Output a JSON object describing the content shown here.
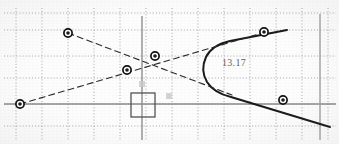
{
  "canvas": {
    "width": 339,
    "height": 144,
    "background": "#fdfdfd"
  },
  "colors": {
    "grid": "#8a8a8a",
    "axis": "#8d8d8d",
    "curve": "#1a1a1a",
    "dashed_line": "#2b2b2b",
    "marker_stroke": "#111111",
    "marker_fill": "#1b1b1b",
    "selection_box": "#555555",
    "label_text": "#4a4a4a",
    "ghost_marker": "#c9c9c9"
  },
  "labels": [
    {
      "name": "coordinate-readout",
      "text": "13.17",
      "x": 222,
      "y": 57
    }
  ],
  "chart_data": {
    "type": "scatter",
    "title": "",
    "subtitle": "",
    "xlabel": "",
    "ylabel": "",
    "grid": true,
    "legend": null,
    "axis_origin_px": {
      "x": 142,
      "y": 104
    },
    "grid_spacing_px": {
      "x": 26,
      "y": 26
    },
    "xlim": [
      -5.5,
      7.6
    ],
    "ylim": [
      -1.5,
      4.0
    ],
    "axes": [
      {
        "name": "x-axis",
        "orientation": "horizontal",
        "y_px": 104,
        "x0_px": 4,
        "x1_px": 336,
        "color": "#8d8d8d"
      },
      {
        "name": "y-axis",
        "orientation": "vertical",
        "x_px": 142,
        "y0_px": 16,
        "y1_px": 140,
        "color": "#8d8d8d"
      },
      {
        "name": "right-boundary-line",
        "orientation": "vertical",
        "x_px": 320,
        "y0_px": 14,
        "y1_px": 140,
        "color": "#a0a0a0"
      }
    ],
    "gridlines": {
      "vertical_px": [
        16,
        42,
        68,
        94,
        120,
        146,
        172,
        198,
        224,
        250,
        276,
        302,
        328
      ],
      "horizontal_px": [
        13,
        30,
        56,
        78,
        104,
        126
      ]
    },
    "points": [
      {
        "label": "P1",
        "px": [
          20,
          104
        ],
        "value": [
          -4.7,
          0.0
        ]
      },
      {
        "label": "P2",
        "px": [
          127,
          70
        ],
        "value": [
          -0.58,
          1.31
        ]
      },
      {
        "label": "P3",
        "px": [
          155,
          56
        ],
        "value": [
          0.5,
          1.85
        ]
      },
      {
        "label": "P4",
        "px": [
          264,
          32
        ],
        "value": [
          4.69,
          2.77
        ]
      },
      {
        "label": "P5",
        "px": [
          283,
          100
        ],
        "value": [
          5.42,
          0.15
        ]
      },
      {
        "label": "P6",
        "px": [
          68,
          33
        ],
        "value": [
          -2.85,
          2.73
        ]
      }
    ],
    "ghost_points": [
      {
        "label": "G1",
        "px": [
          169,
          96
        ],
        "value": [
          1.04,
          0.31
        ]
      },
      {
        "label": "G2",
        "px": [
          142,
          84
        ],
        "value": [
          0.0,
          0.77
        ]
      }
    ],
    "series": [
      {
        "name": "parabola-curve",
        "type": "curve",
        "style": "solid",
        "color": "#1a1a1a",
        "width": 2.0,
        "path_px": "M 287,30 L 230,41 Q 212,45 206,57 Q 200,70 207,82 Q 214,93 231,97 L 330,127"
      },
      {
        "name": "dashed-line-descending",
        "type": "line",
        "style": "dashed",
        "color": "#2b2b2b",
        "width": 1.1,
        "from_px": [
          68,
          33
        ],
        "to_px": [
          232,
          95
        ]
      },
      {
        "name": "dashed-line-ascending",
        "type": "line",
        "style": "dashed",
        "color": "#2b2b2b",
        "width": 1.1,
        "from_px": [
          20,
          104
        ],
        "to_px": [
          262,
          33
        ]
      }
    ],
    "selection_box": {
      "name": "selection-rectangle",
      "px": {
        "x": 131,
        "y": 93,
        "width": 24,
        "height": 24
      }
    }
  }
}
